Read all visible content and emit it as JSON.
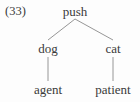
{
  "figure": {
    "example_number": "(33)",
    "background_color": "#fdfdfd",
    "text_color": "#3a3a3a",
    "line_color": "#8a8a8a"
  },
  "tree": {
    "root": {
      "label": "push",
      "x": 75,
      "y": 5
    },
    "level2": [
      {
        "label": "dog",
        "x": 48,
        "y": 42
      },
      {
        "label": "cat",
        "x": 113,
        "y": 42
      }
    ],
    "leaves": [
      {
        "label": "agent",
        "x": 48,
        "y": 83
      },
      {
        "label": "patient",
        "x": 113,
        "y": 83
      }
    ]
  },
  "edges": [
    {
      "from": "push",
      "to": "dog",
      "x1": 75,
      "y1": 19,
      "x2": 48,
      "y2": 40
    },
    {
      "from": "push",
      "to": "cat",
      "x1": 75,
      "y1": 19,
      "x2": 113,
      "y2": 40
    },
    {
      "from": "dog",
      "to": "agent",
      "x1": 48,
      "y1": 57,
      "x2": 48,
      "y2": 81
    },
    {
      "from": "cat",
      "to": "patient",
      "x1": 113,
      "y1": 57,
      "x2": 113,
      "y2": 81
    }
  ]
}
